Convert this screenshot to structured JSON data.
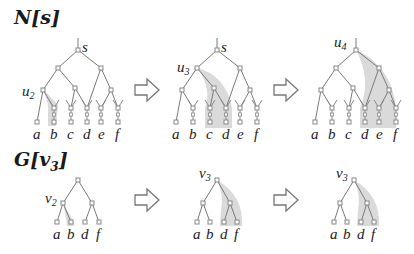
{
  "figure": {
    "row1": {
      "title": "N[s]",
      "panels": [
        {
          "root_label": "s",
          "highlight_label": "u",
          "highlight_sub": "2",
          "leaves": [
            "a",
            "b",
            "c",
            "d",
            "e",
            "f"
          ]
        },
        {
          "root_label": "s",
          "highlight_label": "u",
          "highlight_sub": "3",
          "leaves": [
            "a",
            "b",
            "c",
            "d",
            "e",
            "f"
          ]
        },
        {
          "root_label": "u",
          "root_sub": "4",
          "leaves": [
            "a",
            "b",
            "c",
            "d",
            "e",
            "f"
          ]
        }
      ]
    },
    "row2": {
      "title": "G[v3]",
      "title_main": "G[v",
      "title_sub": "3",
      "title_end": "]",
      "panels": [
        {
          "node_label": "v",
          "node_sub": "2",
          "leaves": [
            "a",
            "b",
            "d",
            "f"
          ]
        },
        {
          "node_label": "v",
          "node_sub": "3",
          "leaves": [
            "a",
            "b",
            "d",
            "f"
          ]
        },
        {
          "node_label": "v",
          "node_sub": "3",
          "leaves": [
            "a",
            "b",
            "d",
            "f"
          ]
        }
      ]
    },
    "arrow_icon": "hollow-right-arrow",
    "colors": {
      "edge": "#7a7a7a",
      "node": "#8a8a8a",
      "highlight": "#d0d0d0",
      "arrow": "#777777"
    }
  }
}
